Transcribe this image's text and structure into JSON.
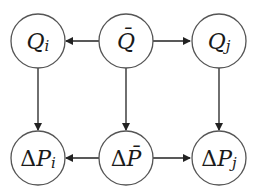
{
  "diagram": {
    "type": "directed-graph",
    "nodes": [
      {
        "id": "Qi",
        "symbol": "Q",
        "subscript": "i",
        "prefix": "",
        "bar": false,
        "cx": 38,
        "cy": 41
      },
      {
        "id": "Qbar",
        "symbol": "Q",
        "subscript": "",
        "prefix": "",
        "bar": true,
        "cx": 126,
        "cy": 41
      },
      {
        "id": "Qj",
        "symbol": "Q",
        "subscript": "j",
        "prefix": "",
        "bar": false,
        "cx": 219,
        "cy": 41
      },
      {
        "id": "dPi",
        "symbol": "P",
        "subscript": "i",
        "prefix": "Δ",
        "bar": false,
        "cx": 38,
        "cy": 158
      },
      {
        "id": "dPbar",
        "symbol": "P",
        "subscript": "",
        "prefix": "Δ",
        "bar": true,
        "cx": 126,
        "cy": 158
      },
      {
        "id": "dPj",
        "symbol": "P",
        "subscript": "j",
        "prefix": "Δ",
        "bar": false,
        "cx": 219,
        "cy": 158
      }
    ],
    "edges": [
      {
        "from": "Qbar",
        "to": "Qi"
      },
      {
        "from": "Qbar",
        "to": "Qj"
      },
      {
        "from": "Qi",
        "to": "dPi"
      },
      {
        "from": "Qbar",
        "to": "dPbar"
      },
      {
        "from": "Qj",
        "to": "dPj"
      },
      {
        "from": "dPbar",
        "to": "dPi"
      },
      {
        "from": "dPbar",
        "to": "dPj"
      }
    ],
    "labels": {
      "Qi": {
        "main": "Q",
        "sub": "i"
      },
      "Qbar": {
        "main": "Q̄"
      },
      "Qj": {
        "main": "Q",
        "sub": "j"
      },
      "dPi": {
        "delta": "Δ",
        "main": "P",
        "sub": "i"
      },
      "dPbar": {
        "delta": "Δ",
        "main": "P̄"
      },
      "dPj": {
        "delta": "Δ",
        "main": "P",
        "sub": "j"
      }
    },
    "colors": {
      "node_stroke": "#555555",
      "edge": "#222222",
      "text": "#1a1a1a",
      "background": "#ffffff"
    }
  }
}
